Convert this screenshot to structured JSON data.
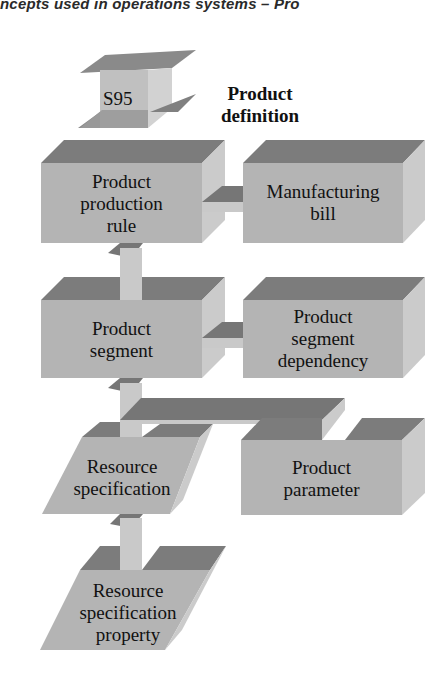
{
  "header": {
    "text": "ncepts used in operations systems – Pro"
  },
  "diagram": {
    "badge": {
      "label": "S95"
    },
    "title": {
      "line1": "Product",
      "line2": "definition"
    },
    "nodes": {
      "product_production_rule": {
        "line1": "Product",
        "line2": "production",
        "line3": "rule"
      },
      "manufacturing_bill": {
        "line1": "Manufacturing",
        "line2": "bill"
      },
      "product_segment": {
        "line1": "Product",
        "line2": "segment"
      },
      "product_segment_dependency": {
        "line1": "Product",
        "line2": "segment",
        "line3": "dependency"
      },
      "resource_specification": {
        "line1": "Resource",
        "line2": "specification"
      },
      "product_parameter": {
        "line1": "Product",
        "line2": "parameter"
      },
      "resource_specification_property": {
        "line1": "Resource",
        "line2": "specification",
        "line3": "property"
      }
    },
    "colors": {
      "top_face": "#7c7c7c",
      "front_face": "#b4b4b4",
      "side_face": "#cbcbcb",
      "connector_dark": "#767676",
      "connector_light": "#c9c9c9"
    }
  }
}
